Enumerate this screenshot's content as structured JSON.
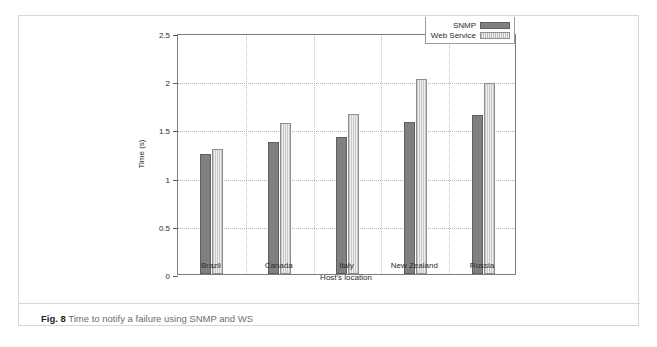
{
  "figure": {
    "caption_label": "Fig. 8",
    "caption_text": "Time to notify a failure using SNMP and WS"
  },
  "chart_data": {
    "type": "bar",
    "title": "",
    "xlabel": "Host's location",
    "ylabel": "Time (s)",
    "ylim": [
      0,
      2.5
    ],
    "yticks": [
      "0",
      "0.5",
      "1",
      "1.5",
      "2",
      "2.5"
    ],
    "ytick_values": [
      0,
      0.5,
      1,
      1.5,
      2,
      2.5
    ],
    "grid": "horizontal-dotted-and-vertical-dotted",
    "legend_position": "top-right",
    "categories": [
      "Brazil",
      "Canada",
      "Italy",
      "New Zealand",
      "Russia"
    ],
    "series": [
      {
        "name": "SNMP",
        "color": "#808080",
        "pattern": "solid",
        "values": [
          1.24,
          1.37,
          1.42,
          1.58,
          1.65
        ]
      },
      {
        "name": "Web Service",
        "color": "#d8d8d8",
        "pattern": "vertical-hatch",
        "values": [
          1.3,
          1.57,
          1.66,
          2.02,
          1.98
        ]
      }
    ]
  }
}
